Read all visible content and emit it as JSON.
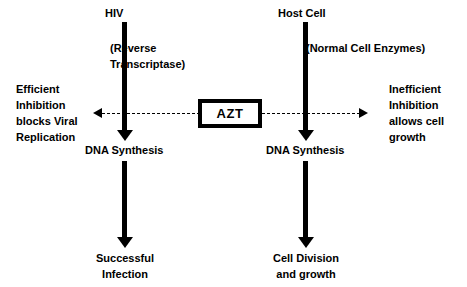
{
  "diagram": {
    "colors": {
      "stroke": "#000000",
      "background": "#ffffff"
    },
    "left_pathway": {
      "source_label": "HIV",
      "enzyme_label_line1": "(Reverse",
      "enzyme_label_line2": "Transcriptase)",
      "midpoint_label": "DNA Synthesis",
      "outcome_line1": "Successful",
      "outcome_line2": "Infection",
      "effect_line1": "Efficient",
      "effect_line2": "Inhibition",
      "effect_line3": "blocks Viral",
      "effect_line4": "Replication"
    },
    "right_pathway": {
      "source_label": "Host Cell",
      "enzyme_label": "(Normal Cell Enzymes)",
      "midpoint_label": "DNA Synthesis",
      "outcome_line1": "Cell Division",
      "outcome_line2": "and growth",
      "effect_line1": "Inefficient",
      "effect_line2": "Inhibition",
      "effect_line3": "allows cell",
      "effect_line4": "growth"
    },
    "drug": {
      "name": "AZT"
    }
  }
}
